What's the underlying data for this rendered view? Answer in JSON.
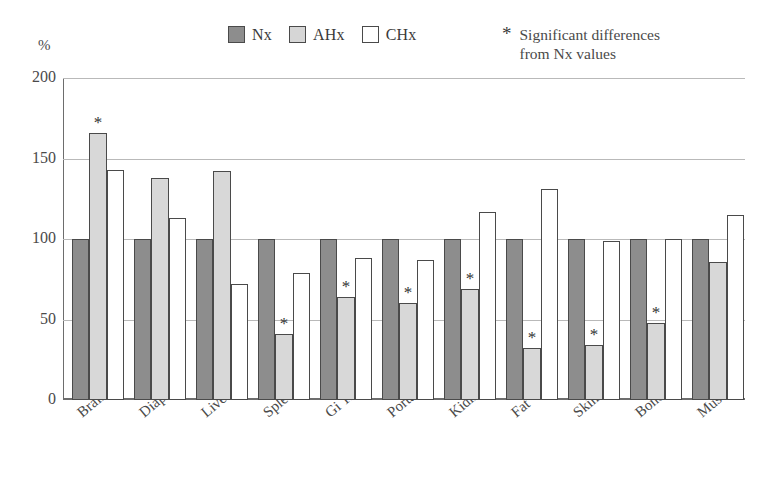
{
  "chart_data": {
    "type": "bar",
    "title": "",
    "subtitle": "",
    "xlabel": "",
    "ylabel": "%",
    "ylim": [
      0,
      200
    ],
    "yticks": [
      0,
      50,
      100,
      150,
      200
    ],
    "grid": true,
    "legend_position": "top-center",
    "categories": [
      "Brain",
      "Diaph",
      "Liver",
      "Spleen",
      "Gi Tract",
      "Portal",
      "Kidney",
      "Fat",
      "Skin",
      "Bone",
      "Muscle"
    ],
    "series": [
      {
        "name": "Nx",
        "color": "#8d8d8d",
        "values": [
          100,
          100,
          100,
          100,
          100,
          100,
          100,
          100,
          100,
          100,
          100
        ],
        "significant": [
          false,
          false,
          false,
          false,
          false,
          false,
          false,
          false,
          false,
          false,
          false
        ]
      },
      {
        "name": "AHx",
        "color": "#d8d8d8",
        "values": [
          166,
          138,
          142,
          41,
          64,
          60,
          69,
          32,
          34,
          48,
          86
        ],
        "significant": [
          true,
          false,
          false,
          true,
          true,
          true,
          true,
          true,
          true,
          true,
          false
        ]
      },
      {
        "name": "CHx",
        "color": "#ffffff",
        "values": [
          143,
          113,
          72,
          79,
          88,
          87,
          117,
          131,
          99,
          100,
          115
        ],
        "significant": [
          false,
          false,
          false,
          false,
          false,
          false,
          false,
          false,
          false,
          false,
          false
        ]
      }
    ],
    "annotations": [
      {
        "symbol": "*",
        "line1": "Significant differences",
        "line2": "from Nx values"
      }
    ]
  },
  "legend": {
    "items": [
      {
        "label": "Nx",
        "swatch": "dark-gray"
      },
      {
        "label": "AHx",
        "swatch": "light-gray"
      },
      {
        "label": "CHx",
        "swatch": "white"
      }
    ]
  },
  "note": {
    "symbol": "*",
    "line1": "Significant differences",
    "line2": "from Nx values"
  },
  "axis": {
    "y_unit": "%",
    "y_ticks": [
      "200",
      "150",
      "100",
      "50",
      "0"
    ]
  }
}
